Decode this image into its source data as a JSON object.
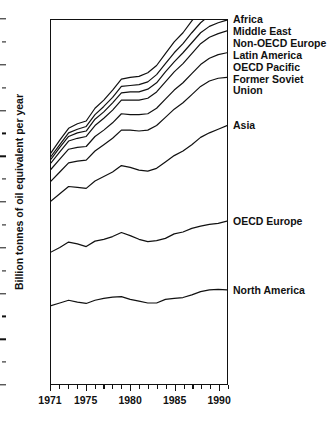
{
  "chart_data": {
    "type": "area",
    "title": "",
    "xlabel": "",
    "ylabel": "Billion tonnes of oil equivalent per year",
    "xlim": [
      1971,
      1991
    ],
    "ylim": [
      0,
      8
    ],
    "grid": false,
    "legend_position": "right-of-plot-inline",
    "stacked": true,
    "note": "Cumulative (stacked) boundary lines; each labelled line is the running total including all regions below it.",
    "x": [
      1971,
      1972,
      1973,
      1974,
      1975,
      1976,
      1977,
      1978,
      1979,
      1980,
      1981,
      1982,
      1983,
      1984,
      1985,
      1986,
      1987,
      1988,
      1989,
      1990,
      1991
    ],
    "y_major_ticks": [
      0,
      1,
      2,
      3,
      4,
      5,
      6,
      7,
      8
    ],
    "y_minor_ticks": [
      0.5,
      1.5,
      2.5,
      3.5,
      4.5,
      5.5,
      6.5,
      7.5
    ],
    "x_major_ticks": [
      1971,
      1975,
      1980,
      1985,
      1990
    ],
    "x_major_labels": [
      "1971",
      "1975",
      "1980",
      "1985",
      "1990"
    ],
    "series": [
      {
        "name": "North America",
        "label": "North America",
        "label_lines": [
          "North America"
        ],
        "cumulative_values": [
          1.72,
          1.78,
          1.84,
          1.8,
          1.77,
          1.84,
          1.88,
          1.91,
          1.92,
          1.86,
          1.82,
          1.78,
          1.78,
          1.86,
          1.88,
          1.9,
          1.96,
          2.03,
          2.07,
          2.08,
          2.07
        ]
      },
      {
        "name": "OECD Europe",
        "label": "OECD Europe",
        "label_lines": [
          "OECD Europe"
        ],
        "cumulative_values": [
          2.9,
          3.0,
          3.12,
          3.08,
          3.02,
          3.14,
          3.18,
          3.24,
          3.33,
          3.26,
          3.18,
          3.13,
          3.15,
          3.2,
          3.3,
          3.34,
          3.42,
          3.47,
          3.51,
          3.53,
          3.58
        ]
      },
      {
        "name": "Asia",
        "label": "Asia",
        "label_lines": [
          "Asia"
        ],
        "cumulative_values": [
          4.02,
          4.18,
          4.34,
          4.32,
          4.3,
          4.46,
          4.56,
          4.66,
          4.8,
          4.76,
          4.7,
          4.68,
          4.74,
          4.88,
          5.02,
          5.12,
          5.26,
          5.42,
          5.52,
          5.6,
          5.68
        ]
      },
      {
        "name": "Former Soviet Union",
        "label": "Former Soviet Union",
        "label_lines": [
          "Former Soviet",
          "Union"
        ],
        "cumulative_values": [
          4.46,
          4.66,
          4.86,
          4.9,
          4.92,
          5.12,
          5.26,
          5.4,
          5.58,
          5.58,
          5.56,
          5.58,
          5.68,
          5.86,
          6.04,
          6.18,
          6.36,
          6.54,
          6.66,
          6.72,
          6.74
        ]
      },
      {
        "name": "OECD Pacific",
        "label": "OECD Pacific",
        "label_lines": [
          "OECD Pacific"
        ],
        "cumulative_values": [
          4.72,
          4.94,
          5.16,
          5.2,
          5.22,
          5.44,
          5.58,
          5.74,
          5.94,
          5.92,
          5.92,
          5.94,
          6.06,
          6.26,
          6.46,
          6.62,
          6.82,
          7.02,
          7.16,
          7.24,
          7.28
        ]
      },
      {
        "name": "Latin America",
        "label": "Latin America",
        "label_lines": [
          "Latin America"
        ],
        "cumulative_values": [
          4.86,
          5.1,
          5.34,
          5.4,
          5.44,
          5.68,
          5.84,
          6.02,
          6.24,
          6.24,
          6.24,
          6.28,
          6.42,
          6.64,
          6.86,
          7.04,
          7.26,
          7.48,
          7.62,
          7.7,
          7.76
        ]
      },
      {
        "name": "Non-OECD Europe",
        "label": "Non-OECD Europe",
        "label_lines": [
          "Non-OECD Europe"
        ],
        "cumulative_values": [
          4.94,
          5.2,
          5.44,
          5.52,
          5.56,
          5.82,
          5.98,
          6.18,
          6.4,
          6.42,
          6.42,
          6.48,
          6.62,
          6.86,
          7.08,
          7.28,
          7.5,
          7.72,
          7.86,
          7.94,
          8.0
        ]
      },
      {
        "name": "Middle East",
        "label": "Middle East",
        "label_lines": [
          "Middle East"
        ],
        "cumulative_values": [
          5.0,
          5.26,
          5.52,
          5.6,
          5.66,
          5.92,
          6.1,
          6.3,
          6.54,
          6.56,
          6.58,
          6.64,
          6.8,
          7.04,
          7.28,
          7.48,
          7.72,
          7.94,
          8.1,
          8.18,
          8.26
        ]
      },
      {
        "name": "Africa",
        "label": "Africa",
        "label_lines": [
          "Africa"
        ],
        "cumulative_values": [
          5.08,
          5.36,
          5.62,
          5.72,
          5.78,
          6.06,
          6.24,
          6.46,
          6.7,
          6.74,
          6.76,
          6.84,
          7.0,
          7.26,
          7.52,
          7.72,
          7.98,
          8.22,
          8.38,
          8.46,
          8.54
        ]
      }
    ],
    "axis": {
      "y_title": "Billion tonnes of oil equivalent per year",
      "line_color": "#111111"
    }
  }
}
